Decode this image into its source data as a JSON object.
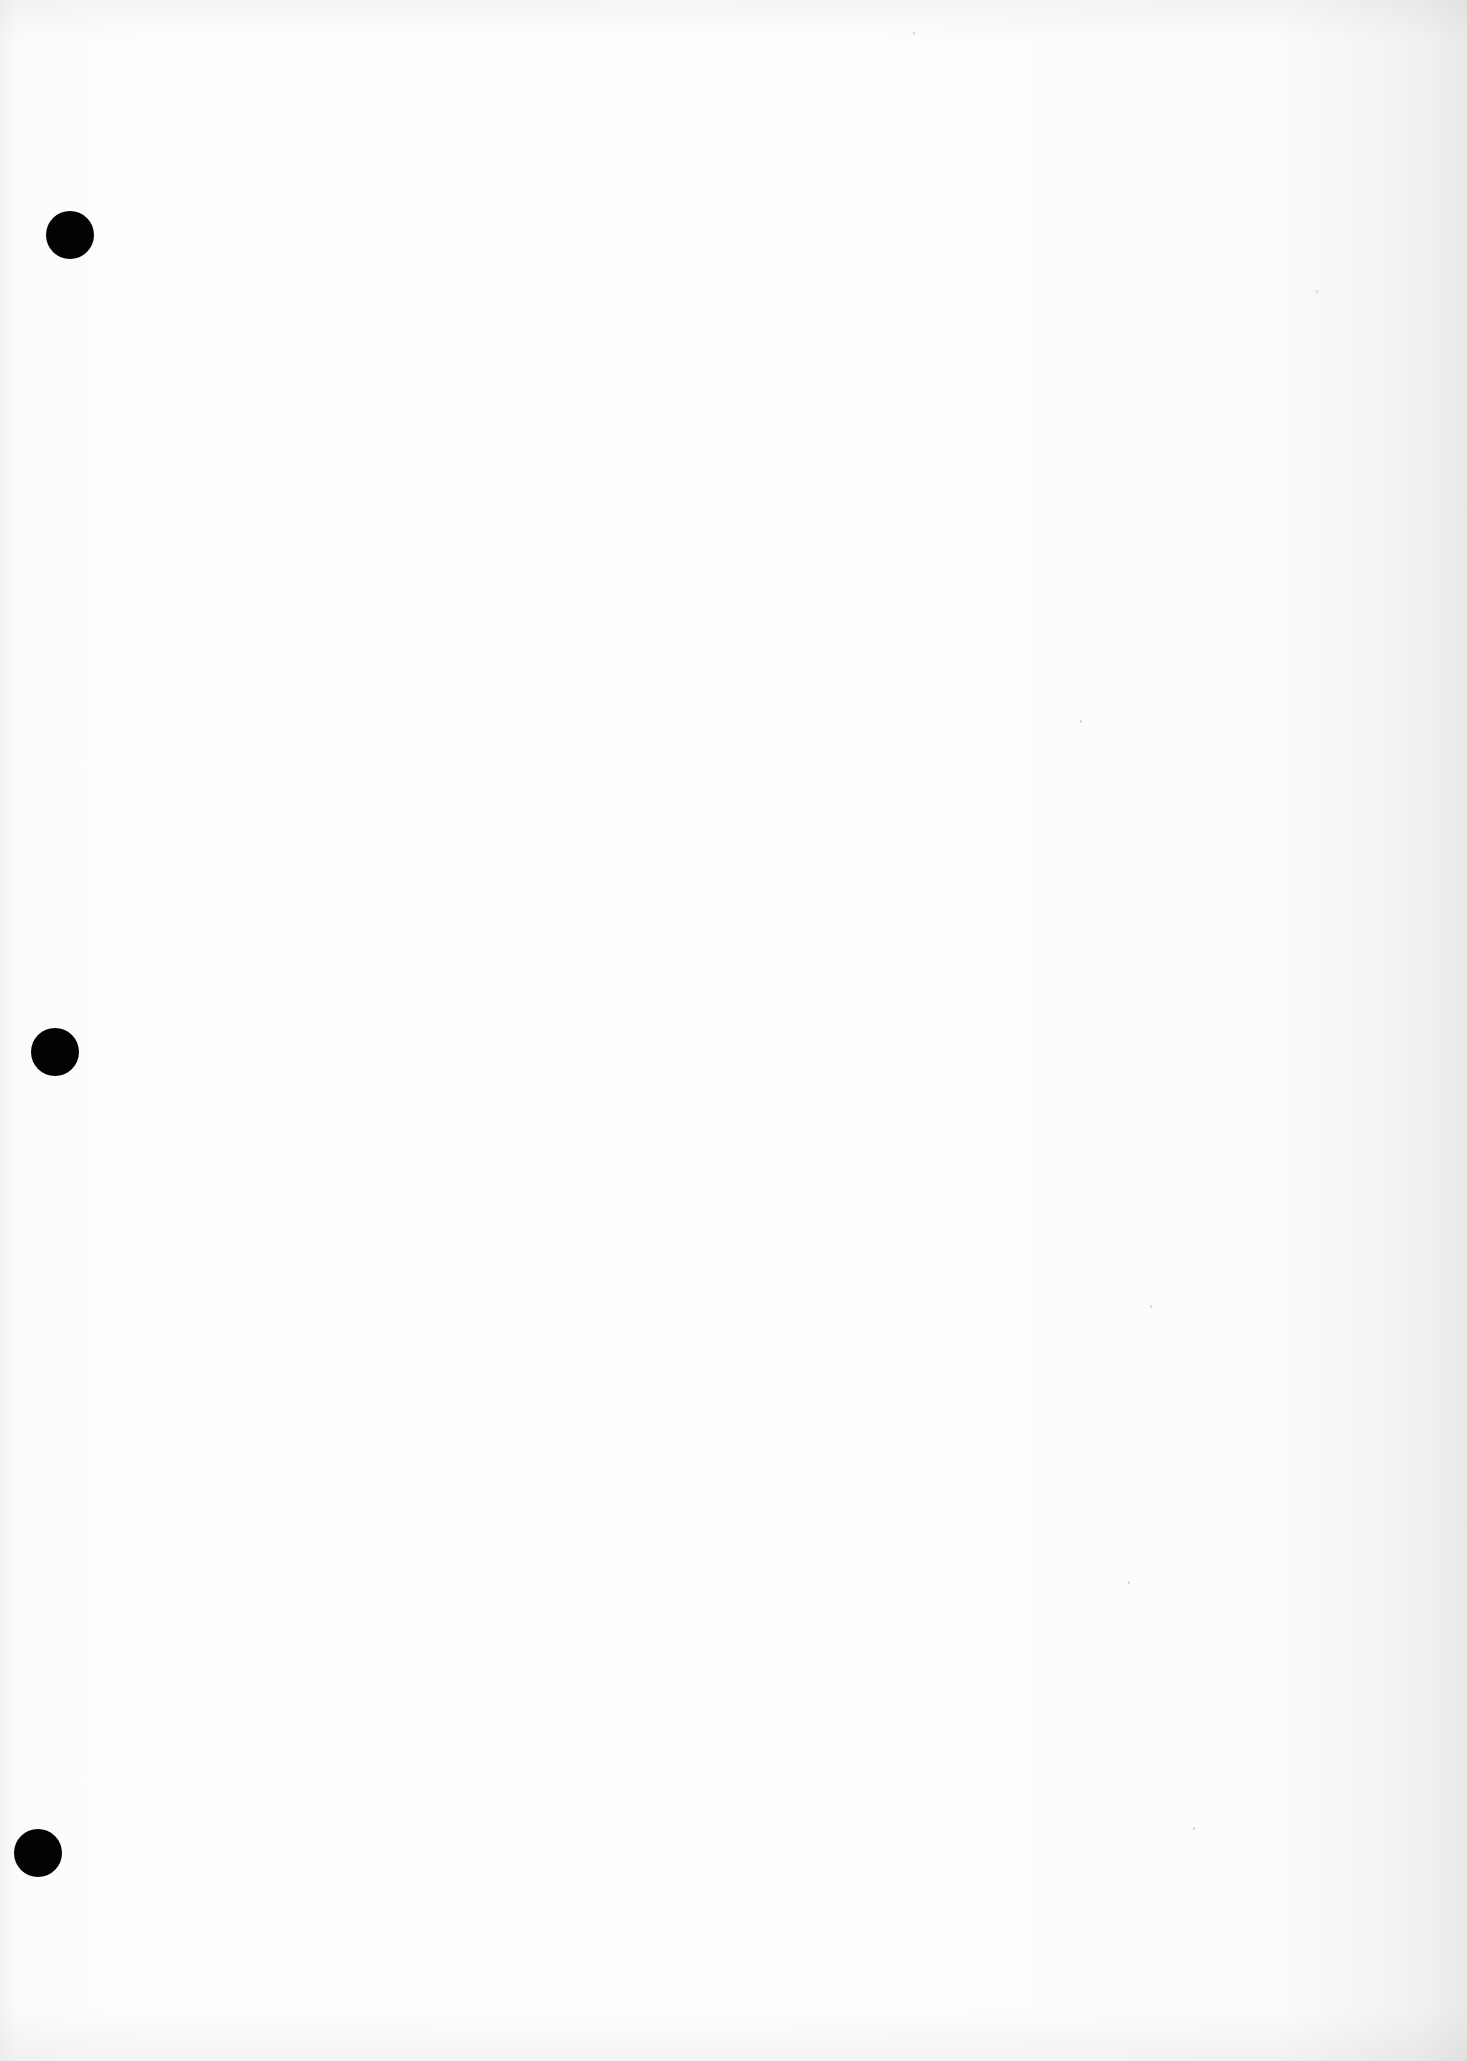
{
  "document": {
    "type": "blank scanned page",
    "background_color": "#fdfdfd",
    "edge_shade_color": "#e9e9e9",
    "text_content": ""
  },
  "punch_holes": [
    {
      "x": 70,
      "y": 235,
      "diameter": 48,
      "color": "#030303"
    },
    {
      "x": 55,
      "y": 1052,
      "diameter": 48,
      "color": "#030303"
    },
    {
      "x": 38,
      "y": 1853,
      "diameter": 48,
      "color": "#030303"
    }
  ]
}
